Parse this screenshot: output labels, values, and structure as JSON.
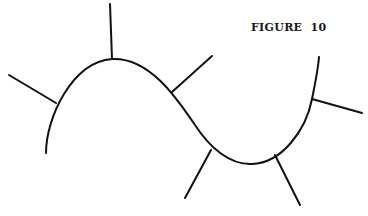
{
  "figure": {
    "caption": "FIGURE  10",
    "stroke_color": "#111111",
    "background": "#ffffff"
  },
  "curve": {
    "description": "S-shaped curve with normal lines drawn at several points",
    "path": "M46,153 C46,118 72,62 112,59 C150,57 178,100 195,125 C210,148 230,165 252,164 C282,163 306,130 312,99 C315,84 318,70 319,57"
  },
  "normals": [
    {
      "name": "normal-left",
      "x1": 9,
      "y1": 75,
      "x2": 56,
      "y2": 103
    },
    {
      "name": "normal-top",
      "x1": 110,
      "y1": 4,
      "x2": 112,
      "y2": 59
    },
    {
      "name": "normal-upper-right",
      "x1": 212,
      "y1": 56,
      "x2": 172,
      "y2": 92
    },
    {
      "name": "normal-lower-left",
      "x1": 211,
      "y1": 150,
      "x2": 185,
      "y2": 198
    },
    {
      "name": "normal-lower-right",
      "x1": 275,
      "y1": 155,
      "x2": 300,
      "y2": 205
    },
    {
      "name": "normal-right",
      "x1": 312,
      "y1": 99,
      "x2": 362,
      "y2": 113
    }
  ]
}
